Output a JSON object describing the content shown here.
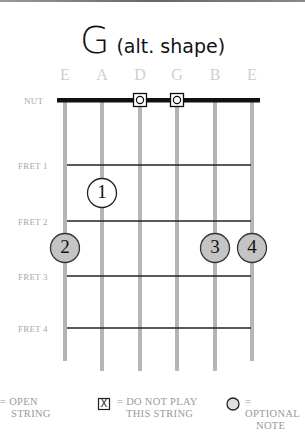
{
  "title": {
    "chord": "G",
    "subtitle": "(alt. shape)"
  },
  "strings": [
    {
      "name": "E",
      "x": 65
    },
    {
      "name": "A",
      "x": 102
    },
    {
      "name": "D",
      "x": 140
    },
    {
      "name": "G",
      "x": 177
    },
    {
      "name": "B",
      "x": 215
    },
    {
      "name": "E",
      "x": 252
    }
  ],
  "labels": {
    "nut": "NUT",
    "fret1": "FRET 1",
    "fret2": "FRET 2",
    "fret3": "FRET 3",
    "fret4": "FRET 4"
  },
  "nut_markers": [
    {
      "string": "D",
      "symbol": "optional-open"
    },
    {
      "string": "G",
      "symbol": "optional-open"
    }
  ],
  "fingers": [
    {
      "number": "1",
      "string": "A",
      "fret": 1,
      "style": "white"
    },
    {
      "number": "2",
      "string": "E",
      "fret": 3,
      "style": "gray"
    },
    {
      "number": "3",
      "string": "B",
      "fret": 3,
      "style": "gray"
    },
    {
      "number": "4",
      "string": "E",
      "fret": 3,
      "style": "gray"
    }
  ],
  "legend": {
    "open_line1": "= OPEN",
    "open_line2": "STRING",
    "mute_line1": "= DO NOT PLAY",
    "mute_line2": "THIS STRING",
    "mute_symbol": "X",
    "optional_line1": "= OPTIONAL",
    "optional_line2": "NOTE"
  },
  "colors": {
    "string": "#b5b5b5",
    "fret": "#222222",
    "nut": "#111111",
    "finger_gray": "#c4c4c4",
    "label": "#a8a8a8"
  }
}
